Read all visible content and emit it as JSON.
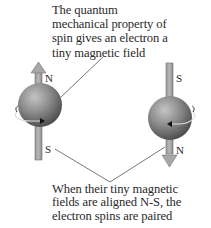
{
  "top_caption": {
    "lines": [
      "The quantum",
      "mechanical property of",
      "spin gives an electron a",
      "tiny magnetic field"
    ]
  },
  "bottom_caption": {
    "lines": [
      "When their tiny magnetic",
      "fields are aligned N-S, the",
      "electron spins are paired"
    ]
  },
  "electrons": [
    {
      "name": "left-electron",
      "arrow_direction": "up",
      "top_label": "N",
      "bottom_label": "S",
      "spin_icon": "counterclockwise-spin-arrow"
    },
    {
      "name": "right-electron",
      "arrow_direction": "down",
      "top_label": "S",
      "bottom_label": "N",
      "spin_icon": "clockwise-spin-arrow"
    }
  ],
  "colors": {
    "sphere_light": "#b8b8b8",
    "sphere_mid": "#8a8a8a",
    "sphere_dark": "#4a4a4a",
    "arrow_fill": "#a8a8a8",
    "arrow_stroke": "#6e6e6e",
    "leader_line": "#555555",
    "text": "#2a2a2a"
  }
}
